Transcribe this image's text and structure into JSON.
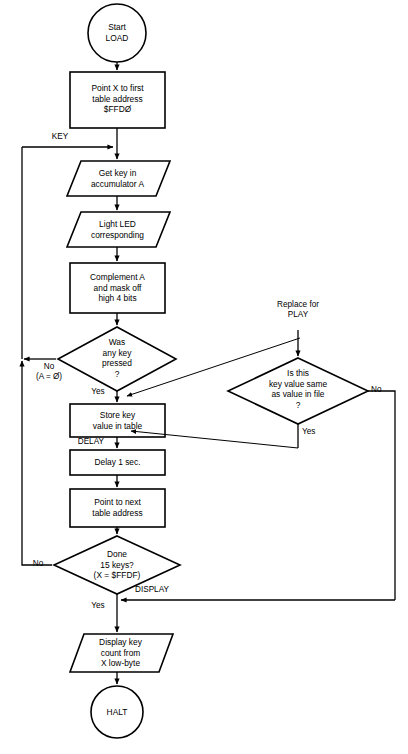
{
  "diagram": {
    "stroke_color": "#000000",
    "background_color": "#ffffff"
  },
  "nodes": {
    "start": {
      "label": "Start\nLOAD",
      "shape": "terminator-circle"
    },
    "point_x_first": {
      "label": "Point X to first\ntable address\n$FFDØ",
      "shape": "process-rect"
    },
    "get_key": {
      "label": "Get key in\naccumulator A",
      "shape": "io-parallelogram"
    },
    "light_led": {
      "label": "Light LED\ncorresponding",
      "shape": "io-parallelogram"
    },
    "complement_a": {
      "label": "Complement A\nand mask off\nhigh 4 bits",
      "shape": "process-rect"
    },
    "key_pressed": {
      "label": "Was\nany key\npressed\n?",
      "shape": "decision-diamond"
    },
    "store_key": {
      "label": "Store key\nvalue in table",
      "shape": "process-rect"
    },
    "delay_1s": {
      "label": "Delay 1 sec.",
      "shape": "process-rect"
    },
    "point_next": {
      "label": "Point to next\ntable address",
      "shape": "process-rect"
    },
    "done_15_keys": {
      "label": "Done\n15 keys?\n(X = $FFDF)",
      "shape": "decision-diamond"
    },
    "display_key_count": {
      "label": "Display key\ncount from\nX low-byte",
      "shape": "io-parallelogram"
    },
    "halt": {
      "label": "HALT",
      "shape": "terminator-circle"
    },
    "value_same": {
      "label": "Is this\nkey value same\nas value in file\n?",
      "shape": "decision-diamond"
    }
  },
  "edge_labels": {
    "key": "KEY",
    "no_a_zero": "No\n(A = Ø)",
    "yes_key_pressed": "Yes",
    "delay": "DELAY",
    "no_done": "No",
    "yes_done": "Yes",
    "display": "DISPLAY",
    "no_value_same": "No",
    "yes_value_same": "Yes"
  },
  "annotations": {
    "replace_for_play": "Replace for\nPLAY"
  }
}
